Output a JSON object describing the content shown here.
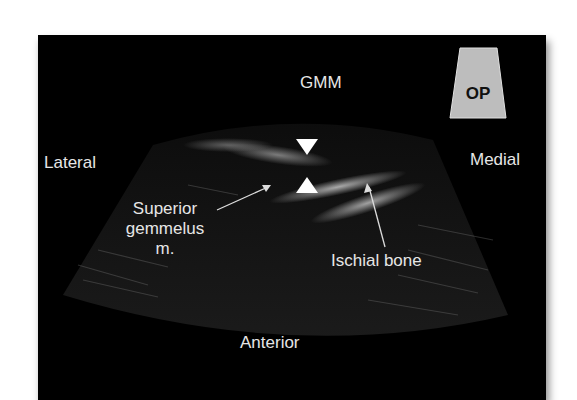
{
  "figure": {
    "type": "ultrasound-image",
    "probe_badge": {
      "label": "OP",
      "colors": {
        "fill": "#bdbdbd",
        "text": "#111111"
      }
    },
    "labels": {
      "top": "GMM",
      "left": "Lateral",
      "right": "Medial",
      "bottom": "Anterior",
      "superior_gemmelus": [
        "Superior",
        "gemmelus",
        "m."
      ],
      "ischial_bone": "Ischial bone"
    },
    "markers": [
      "arrowhead-down",
      "arrowhead-up"
    ],
    "colors": {
      "background": "#000000",
      "label": "#e6e6e6",
      "page": "#ffffff"
    }
  }
}
